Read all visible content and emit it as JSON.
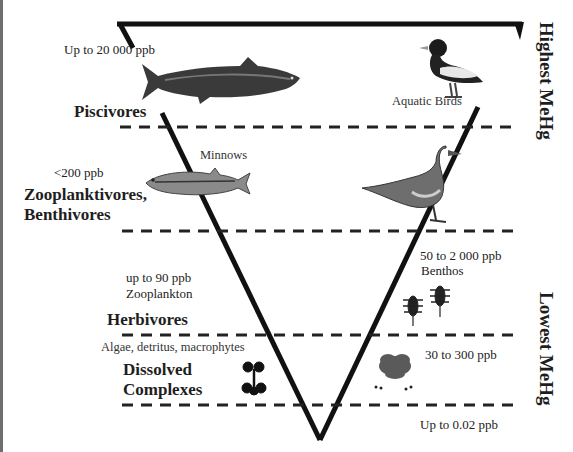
{
  "figure": {
    "type": "inverted-pyramid-food-web",
    "side_labels": {
      "top": "Highest MeHg",
      "bottom": "Lowest MeHg"
    },
    "levels": [
      {
        "trophic_label": "Piscivores",
        "concentration": "Up to 20 000 ppb",
        "organisms": [
          "trout-fish",
          "duck"
        ],
        "organism_label": "Aquatic Birds"
      },
      {
        "trophic_label": "Zooplanktivores, Benthivores",
        "trophic_label_line1": "Zooplanktivores,",
        "trophic_label_line2": "Benthivores",
        "concentration": "<200 ppb",
        "organism_label": "Minnows",
        "organisms": [
          "minnow-fish",
          "water-bird"
        ]
      },
      {
        "trophic_label": "Herbivores",
        "left_concentration": "up to 90 ppb",
        "left_organism_label": "Zooplankton",
        "right_concentration": "50 to 2 000 ppb",
        "right_organism_label": "Benthos",
        "organisms": [
          "benthic-insect-larvae"
        ]
      },
      {
        "trophic_label": "Dissolved Complexes",
        "trophic_label_line1": "Dissolved",
        "trophic_label_line2": "Complexes",
        "organism_label": "Algae, detritus, macrophytes",
        "right_concentration": "30 to 300 ppb",
        "organisms": [
          "molecule",
          "macrophyte-plant"
        ]
      },
      {
        "trophic_label": "",
        "right_concentration": "Up to 0.02 ppb"
      }
    ]
  }
}
